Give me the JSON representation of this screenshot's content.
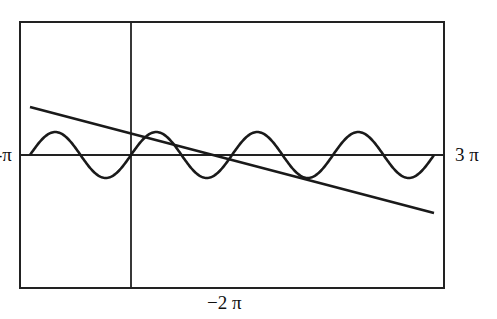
{
  "chart_data": {
    "type": "line",
    "title": "",
    "xlabel": "",
    "ylabel": "",
    "x_tick_labels": {
      "left": "-π",
      "right": "3 π",
      "bottom": "−2 π"
    },
    "series": [
      {
        "name": "sine wave",
        "description": "oscillating curve, 4 full periods across the frame, centered on horizontal axis",
        "amplitude_px": 23,
        "periods": 4
      },
      {
        "name": "straight line",
        "description": "decreasing line from upper-left to lower-right",
        "start_px": [
          30,
          107
        ],
        "end_px": [
          434,
          213
        ]
      }
    ],
    "axes": {
      "horizontal_axis_y_px": 155,
      "vertical_axis_x_px": 131
    },
    "frame_px": {
      "left": 20,
      "top": 22,
      "right": 444,
      "bottom": 288
    },
    "grid": false,
    "legend": false
  },
  "labels": {
    "left": "-π",
    "right": "3 π",
    "bottom": "−2 π"
  }
}
